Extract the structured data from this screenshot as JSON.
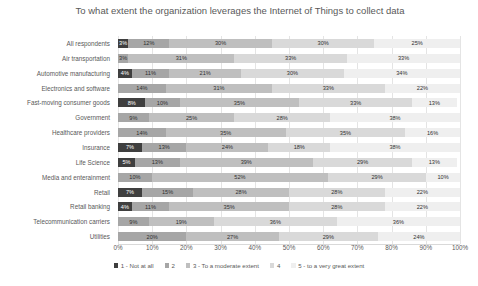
{
  "chart_data": {
    "type": "bar",
    "subtype": "stacked-horizontal-100",
    "title": "To what extent the organization leverages the Internet of Things to collect data",
    "xlabel": "",
    "ylabel": "",
    "xlim": [
      0,
      100
    ],
    "grid": true,
    "legend_position": "bottom",
    "xticks": [
      "0%",
      "10%",
      "20%",
      "30%",
      "40%",
      "50%",
      "60%",
      "70%",
      "80%",
      "90%",
      "100%"
    ],
    "xtick_values": [
      0,
      10,
      20,
      30,
      40,
      50,
      60,
      70,
      80,
      90,
      100
    ],
    "categories": [
      "All respondents",
      "Air transportation",
      "Automotive manufacturing",
      "Electronics and software",
      "Fast-moving consumer goods",
      "Government",
      "Healthcare providers",
      "Insurance",
      "Life Science",
      "Media and enterainment",
      "Retail",
      "Retail banking",
      "Telecommunication carriers",
      "Utilities"
    ],
    "series": [
      {
        "name": "1 - Not at all",
        "color": "#3f3f3f",
        "values": [
          3,
          0,
          4,
          0,
          8,
          0,
          0,
          7,
          5,
          0,
          7,
          4,
          0,
          0
        ]
      },
      {
        "name": "2",
        "color": "#a6a6a6",
        "values": [
          12,
          3,
          11,
          14,
          10,
          9,
          14,
          13,
          13,
          10,
          15,
          11,
          9,
          20
        ]
      },
      {
        "name": "3 - To a moderate extent",
        "color": "#bfbfbf",
        "values": [
          30,
          31,
          21,
          31,
          35,
          25,
          35,
          24,
          39,
          52,
          28,
          35,
          19,
          27
        ]
      },
      {
        "name": "4",
        "color": "#d9d9d9",
        "values": [
          30,
          33,
          30,
          33,
          33,
          28,
          35,
          18,
          29,
          29,
          28,
          28,
          36,
          29
        ]
      },
      {
        "name": "5 - to a very great extent",
        "color": "#efefef",
        "values": [
          25,
          33,
          34,
          22,
          13,
          38,
          16,
          38,
          13,
          10,
          22,
          22,
          36,
          24
        ]
      }
    ],
    "bar_labels": [
      [
        "3%",
        "12%",
        "30%",
        "30%",
        "25%"
      ],
      [
        "0%",
        "3%",
        "31%",
        "33%",
        "33%"
      ],
      [
        "4%",
        "11%",
        "21%",
        "30%",
        "34%"
      ],
      [
        "",
        "14%",
        "31%",
        "33%",
        "22%"
      ],
      [
        "8%",
        "10%",
        "35%",
        "33%",
        "13%"
      ],
      [
        "",
        "9%",
        "25%",
        "28%",
        "38%"
      ],
      [
        "",
        "14%",
        "35%",
        "35%",
        "16%"
      ],
      [
        "7%",
        "13%",
        "24%",
        "18%",
        "38%"
      ],
      [
        "5%",
        "13%",
        "39%",
        "29%",
        "13%"
      ],
      [
        "",
        "10%",
        "52%",
        "29%",
        "10%"
      ],
      [
        "7%",
        "15%",
        "28%",
        "28%",
        "22%"
      ],
      [
        "4%",
        "11%",
        "35%",
        "28%",
        "22%"
      ],
      [
        "",
        "9%",
        "19%",
        "36%",
        "36%"
      ],
      [
        "",
        "20%",
        "27%",
        "29%",
        "24%"
      ]
    ]
  }
}
